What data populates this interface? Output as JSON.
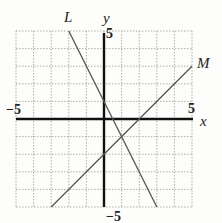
{
  "chart_data": {
    "type": "line",
    "title": "",
    "xlabel": "x",
    "ylabel": "y",
    "xlim": [
      -5,
      5
    ],
    "ylim": [
      -5,
      5
    ],
    "grid": true,
    "tick_labels": {
      "x_min": "−5",
      "x_max": "5",
      "y_max": "5",
      "y_min": "−5"
    },
    "series": [
      {
        "name": "L",
        "equation": "y = -2x + 1",
        "points": [
          [
            -2,
            5
          ],
          [
            3,
            -5
          ]
        ],
        "color": "#555555"
      },
      {
        "name": "M",
        "equation": "y = x - 2",
        "points": [
          [
            -3,
            -5
          ],
          [
            5,
            3
          ]
        ],
        "color": "#555555"
      }
    ],
    "annotations": [
      {
        "text": "intersection",
        "point": [
          1,
          -1
        ]
      }
    ]
  },
  "labels": {
    "line_L": "L",
    "line_M": "M",
    "axis_x": "x",
    "axis_y": "y",
    "x_min": "−5",
    "x_max": "5",
    "y_max": "5",
    "y_min": "−5"
  }
}
